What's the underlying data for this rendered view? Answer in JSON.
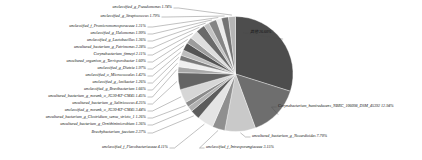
{
  "chart_data": {
    "type": "pie",
    "title": "",
    "legend_position": "labels-with-leader-lines",
    "units": "percent",
    "categories": [
      "其他",
      "Corynebacterium_humireducens_NBRC_106098_DSM_45392",
      "uncultured_bacterium_g_Nocardioides",
      "unclassified_f_Intrasporangiaceae",
      "unclassified_f_Flavobacteriaceae",
      "Brachybacterium_faecium",
      "uncultured_bacterium_g_Ornithinimicrobium",
      "uncultured_bacterium_g_Clostridium_sensu_stricto_1",
      "unclassified_g_norank_o_JG30-KF-CM45",
      "uncultured_bacterium_g_Salinicoccus",
      "uncultured_bacterium_g_norank_o_JG30-KF-CM45",
      "unclassified_g_Brevibacterium",
      "unclassified_g_Amikacter",
      "unclassified_o_Micrococcales",
      "unclassified_g_Dietzia",
      "uncultured_organism_g_Terrisporobacter",
      "Corynebacterium_finneyi",
      "uncultured_bacterium_g_Petrimonas",
      "unclassified_g_Lactobacillus",
      "unclassified_g_Halomonas",
      "unclassified_f_Promicromonosporaceae",
      "unclassified_g_Streptococcus",
      "unclassified_g_Pseudomonas"
    ],
    "values": [
      26.6,
      12.94,
      7.7,
      3.15,
      4.11,
      2.37,
      1.36,
      1.26,
      3.44,
      4.25,
      1.45,
      1.66,
      1.26,
      1.42,
      1.97,
      1.6,
      2.11,
      2.28,
      1.36,
      1.99,
      1.31,
      1.79,
      1.74
    ],
    "colors": [
      "#4d4d4d",
      "#6e6e6e",
      "#c9c9c9",
      "#8f8f8f",
      "#e4e4e4",
      "#5c5c5c",
      "#b0b0b0",
      "#8a8a8a",
      "#d6d6d6",
      "#646464",
      "#a8a8a8",
      "#efefef",
      "#7a7a7a",
      "#bdbdbd",
      "#545454",
      "#9c9c9c",
      "#dedede",
      "#6a6a6a",
      "#c2c2c2",
      "#858585",
      "#ebebeb",
      "#737373",
      "#b5b5b5"
    ]
  },
  "labels": {
    "other": "其他 26.60%",
    "corynebacterium_humireducens": "Corynebacterium_humireducens_NBRC_106098_DSM_45392 12.94%",
    "nocardioides": "uncultured_bacterium_g_Nocardioides 7.70%",
    "intrasporangiaceae": "unclassified_f_Intrasporangiaceae 3.15%",
    "flavobacteriaceae": "unclassified_f_Flavobacteriaceae 4.11%",
    "brachybacterium": "Brachybacterium_faecium 2.37%",
    "ornithinimicrobium": "uncultured_bacterium_g_Ornithinimicrobium 1.36%",
    "clostridium": "uncultured_bacterium_g_Clostridium_sensu_stricto_1 1.26%",
    "norank_unclassified": "unclassified_g_norank_o_JG30-KF-CM45 3.44%",
    "salinicoccus": "uncultured_bacterium_g_Salinicoccus 4.25%",
    "norank_uncultured": "uncultured_bacterium_g_norank_o_JG30-KF-CM45 1.45%",
    "brevibacterium": "unclassified_g_Brevibacterium 1.66%",
    "amikacter": "unclassified_g_Amikacter 1.26%",
    "micrococcales": "unclassified_o_Micrococcales 1.42%",
    "dietzia": "unclassified_g_Dietzia 1.97%",
    "terrisporobacter": "uncultured_organism_g_Terrisporobacter 1.60%",
    "corynebacterium_finneyi": "Corynebacterium_finneyi 2.11%",
    "petrimonas": "uncultured_bacterium_g_Petrimonas 2.28%",
    "lactobacillus": "unclassified_g_Lactobacillus 1.36%",
    "halomonas": "unclassified_g_Halomonas 1.99%",
    "promicromonosporaceae": "unclassified_f_Promicromonosporaceae 1.31%",
    "streptococcus": "unclassified_g_Streptococcus 1.79%",
    "pseudomonas": "unclassified_g_Pseudomonas 1.74%"
  }
}
